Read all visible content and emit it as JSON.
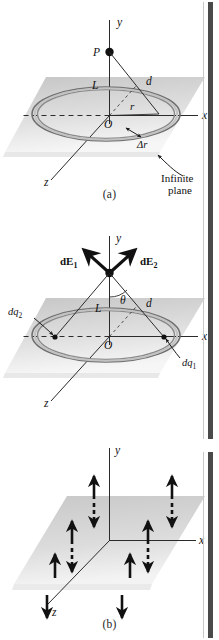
{
  "figure": {
    "panel_count": 3
  },
  "panels": [
    {
      "id": "a",
      "caption": "(a)",
      "axes": {
        "y": "y",
        "x": "x",
        "z": "z"
      },
      "labels": {
        "point_p": "P",
        "origin": "O",
        "length_l": "L",
        "distance_d": "d",
        "radius_r": "r",
        "ring_width": "Δr",
        "plane_note_line1": "Infinite",
        "plane_note_line2": "plane"
      }
    },
    {
      "id": "b",
      "caption": "(b)",
      "axes": {
        "y": "y",
        "x": "x",
        "z": "z"
      },
      "labels": {
        "field_1": "dE",
        "field_1_sub": "1",
        "field_2": "dE",
        "field_2_sub": "2",
        "angle_theta": "θ",
        "origin": "O",
        "length_l": "L",
        "distance_d": "d",
        "charge_1": "dq",
        "charge_1_sub": "1",
        "charge_2": "dq",
        "charge_2_sub": "2"
      }
    },
    {
      "id": "c",
      "caption": "(c)",
      "axes": {
        "y": "y",
        "x": "x",
        "z": "z"
      },
      "equations": {
        "above_plane": {
          "lhs": "E",
          "relation": "=",
          "sign": "",
          "numerator": "σ",
          "denominator_coefficient": "2",
          "denominator_symbol": "ε",
          "denominator_subscript": "0",
          "unit_vector": "j",
          "plain": "E = σ / 2ε₀ j"
        },
        "below_plane": {
          "lhs": "E",
          "relation": "=",
          "sign": "−",
          "numerator": "σ",
          "denominator_coefficient": "2",
          "denominator_symbol": "ε",
          "denominator_subscript": "0",
          "unit_vector": "j",
          "plain": "E = − σ / 2ε₀ j"
        }
      },
      "arrow_counts": {
        "double_headed_dashed_on_plane": 4,
        "single_up_front": 2,
        "single_down_front": 2
      }
    }
  ],
  "colors": {
    "ink": "#1a1a1a",
    "plane_fill_back": "#c4c4c4",
    "plane_fill_front": "#f2f2f2",
    "ring_stroke": "#6e6e6e",
    "ring_fill": "#bdbdbd",
    "edge_bar": "#4a4a4a",
    "background": "#ffffff"
  }
}
